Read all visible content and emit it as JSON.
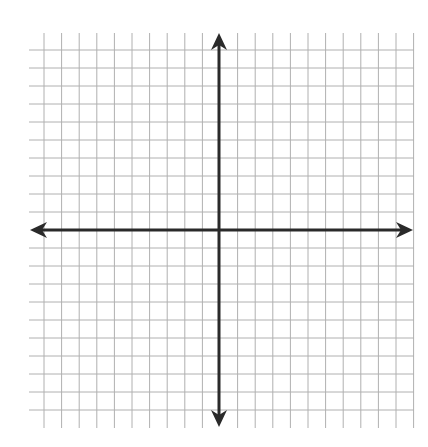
{
  "diagram": {
    "title": "",
    "type": "coordinate-plane",
    "grid": {
      "vertical_lines_x": [
        44,
        61.6,
        79.2,
        96.8,
        114.4,
        132,
        149.6,
        167.2,
        184.8,
        202.4,
        237.6,
        255.2,
        272.8,
        290.4,
        308,
        325.6,
        343.2,
        360.8,
        378.4,
        396,
        413.6
      ],
      "horizontal_lines_y": [
        50,
        68,
        86,
        104,
        122,
        140,
        158,
        176,
        194,
        212,
        248,
        266,
        284,
        302,
        320,
        338,
        356,
        374,
        392,
        410
      ],
      "v_extent": [
        33,
        428
      ],
      "h_extent": [
        29,
        414
      ],
      "color": "#b0b0b0"
    },
    "axes": {
      "x_axis": {
        "y": 230,
        "from": 30,
        "to": 413,
        "arrows": "both"
      },
      "y_axis": {
        "x": 219,
        "from": 33,
        "to": 427,
        "arrows": "both"
      },
      "color": "#2a2a2a"
    }
  }
}
